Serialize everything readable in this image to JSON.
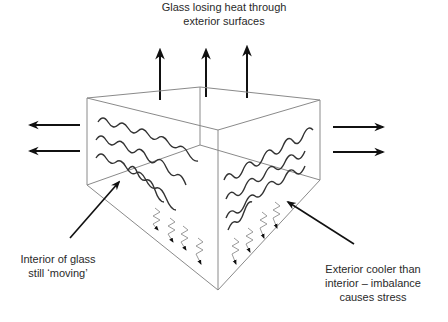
{
  "diagram": {
    "title_lines": [
      "Glass losing heat through",
      "exterior surfaces"
    ],
    "left_annotation_lines": [
      "Interior of glass",
      "still ‘moving’"
    ],
    "right_annotation_lines": [
      "Exterior cooler than",
      "interior – imbalance",
      "causes stress"
    ],
    "colors": {
      "box_edge": "#8a8a8a",
      "arrow": "#111111",
      "wave": "#333333",
      "zigzag": "#9a9a9a"
    },
    "elements": {
      "up_arrows": 3,
      "left_arrows": 2,
      "right_arrows": 2,
      "left_face_waves": 4,
      "right_face_waves": 4,
      "left_face_zigzags": 4,
      "right_face_zigzags": 4
    }
  }
}
